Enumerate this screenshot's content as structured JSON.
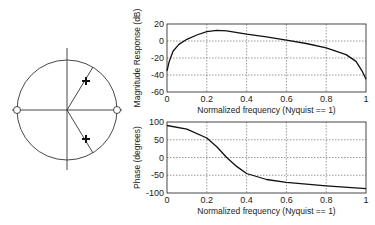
{
  "chart_data": [
    {
      "type": "diagram",
      "title": "Pole-zero plot",
      "unit_circle": true,
      "zeros": [
        {
          "re": -1,
          "im": 0
        },
        {
          "re": 1,
          "im": 0
        }
      ],
      "poles": [
        {
          "re": 0.38,
          "im": 0.58
        },
        {
          "re": 0.38,
          "im": -0.58
        }
      ],
      "markers": {
        "zero": "o",
        "pole": "+"
      }
    },
    {
      "type": "line",
      "title": "",
      "xlabel": "Normalized frequency (Nyquist == 1)",
      "ylabel": "Magnitude Response (dB)",
      "xlim": [
        0,
        1
      ],
      "ylim": [
        -60,
        20
      ],
      "xticks": [
        "0",
        "0.2",
        "0.4",
        "0.6",
        "0.8",
        "1"
      ],
      "yticks": [
        "20",
        "0",
        "-20",
        "-40",
        "-60"
      ],
      "grid": true,
      "x": [
        0,
        0.01,
        0.03,
        0.06,
        0.1,
        0.15,
        0.2,
        0.25,
        0.3,
        0.4,
        0.5,
        0.6,
        0.7,
        0.8,
        0.9,
        0.95,
        0.98,
        1.0
      ],
      "values": [
        -35,
        -25,
        -12,
        -4,
        2,
        7,
        11,
        12.5,
        12,
        8,
        5,
        1,
        -3,
        -8,
        -16,
        -24,
        -35,
        -45
      ]
    },
    {
      "type": "line",
      "title": "",
      "xlabel": "Normalized frequency (Nyquist == 1)",
      "ylabel": "Phase (degrees)",
      "xlim": [
        0,
        1
      ],
      "ylim": [
        -100,
        100
      ],
      "xticks": [
        "0",
        "0.2",
        "0.4",
        "0.6",
        "0.8",
        "1"
      ],
      "yticks": [
        "100",
        "50",
        "0",
        "-50",
        "-100"
      ],
      "grid": true,
      "x": [
        0,
        0.1,
        0.2,
        0.25,
        0.3,
        0.35,
        0.4,
        0.5,
        0.6,
        0.8,
        1.0
      ],
      "values": [
        90,
        80,
        55,
        30,
        0,
        -25,
        -45,
        -62,
        -70,
        -80,
        -88
      ]
    }
  ]
}
